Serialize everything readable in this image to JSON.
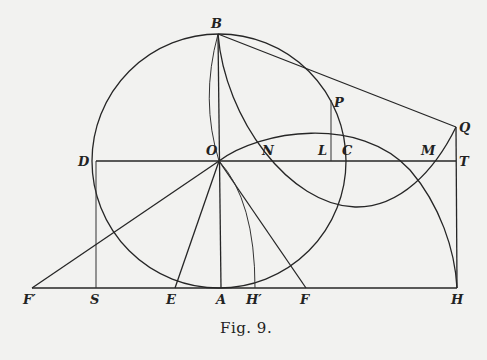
{
  "figure": {
    "caption": "Fig. 9.",
    "points": {
      "B": "B",
      "P": "P",
      "Q": "Q",
      "D": "D",
      "O": "O",
      "N": "N",
      "L": "L",
      "C": "C",
      "M": "M",
      "T": "T",
      "F_prime": "F′",
      "S": "S",
      "E": "E",
      "A": "A",
      "H_prime": "H′",
      "F": "F",
      "H": "H"
    }
  }
}
